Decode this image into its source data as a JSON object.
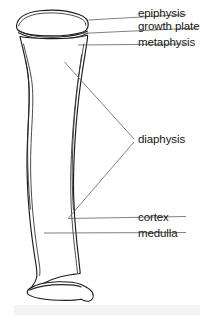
{
  "figure": {
    "background_color": "#ffffff",
    "line_color": "#1a1a1a",
    "leader_line_color": "#55555c",
    "text_color": "#171717"
  },
  "labels": {
    "epiphysis": "epiphysis",
    "growth_plate": "growth plate",
    "metaphysis": "metaphysis",
    "diaphysis": "diaphysis",
    "cortex": "cortex",
    "medulla": "medulla"
  },
  "parts": [
    {
      "id": "epiphysis",
      "label": "epiphysis",
      "leader": "straight"
    },
    {
      "id": "growth-plate",
      "label": "growth plate",
      "leader": "straight"
    },
    {
      "id": "metaphysis",
      "label": "metaphysis",
      "leader": "straight"
    },
    {
      "id": "diaphysis",
      "label": "diaphysis",
      "leader": "bracket"
    },
    {
      "id": "cortex",
      "label": "cortex",
      "leader": "straight"
    },
    {
      "id": "medulla",
      "label": "medulla",
      "leader": "straight"
    }
  ]
}
